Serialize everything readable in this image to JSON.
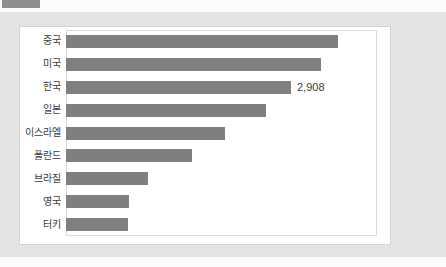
{
  "colors": {
    "bar": "#7f7f7f",
    "panel": "#e4e4e4",
    "tab": "#8e8e8e",
    "card_bg": "#ffffff",
    "card_border": "#d4d4d4",
    "plot_border": "#dadada",
    "text": "#3d3d3d"
  },
  "chart_data": {
    "type": "bar",
    "orientation": "horizontal",
    "categories": [
      "중국",
      "미국",
      "한국",
      "일본",
      "이스라엘",
      "폴란드",
      "브라질",
      "영국",
      "터키"
    ],
    "values": [
      3515,
      3295,
      2908,
      2585,
      2055,
      1630,
      1060,
      815,
      800
    ],
    "data_labels": [
      "",
      "",
      "2,908",
      "",
      "",
      "",
      "",
      "",
      ""
    ],
    "title": "",
    "xlabel": "",
    "ylabel": "",
    "xlim": [
      0,
      4020
    ],
    "grid": false,
    "legend": false
  }
}
